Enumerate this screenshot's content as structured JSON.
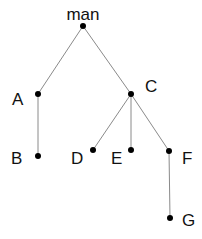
{
  "diagram": {
    "type": "tree",
    "colors": {
      "edge": "#8a8a8a",
      "node": "#000000",
      "label": "#111111",
      "background": "#ffffff"
    },
    "nodes": [
      {
        "id": "man",
        "label": "man",
        "x": 83,
        "y": 26,
        "lx": 83,
        "ly": 20,
        "anchor": "middle"
      },
      {
        "id": "A",
        "label": "A",
        "x": 38,
        "y": 94,
        "lx": 12,
        "ly": 105,
        "anchor": "start"
      },
      {
        "id": "C",
        "label": "C",
        "x": 131,
        "y": 94,
        "lx": 145,
        "ly": 92,
        "anchor": "start"
      },
      {
        "id": "B",
        "label": "B",
        "x": 38,
        "y": 156,
        "lx": 11,
        "ly": 164,
        "anchor": "start"
      },
      {
        "id": "D",
        "label": "D",
        "x": 93,
        "y": 150,
        "lx": 71,
        "ly": 164,
        "anchor": "start"
      },
      {
        "id": "E",
        "label": "E",
        "x": 131,
        "y": 150,
        "lx": 111,
        "ly": 164,
        "anchor": "start"
      },
      {
        "id": "F",
        "label": "F",
        "x": 169,
        "y": 151,
        "lx": 182,
        "ly": 164,
        "anchor": "start"
      },
      {
        "id": "G",
        "label": "G",
        "x": 170,
        "y": 218,
        "lx": 182,
        "ly": 226,
        "anchor": "start"
      }
    ],
    "edges": [
      {
        "from": "man",
        "to": "A"
      },
      {
        "from": "man",
        "to": "C"
      },
      {
        "from": "A",
        "to": "B"
      },
      {
        "from": "C",
        "to": "D"
      },
      {
        "from": "C",
        "to": "E"
      },
      {
        "from": "C",
        "to": "F"
      },
      {
        "from": "F",
        "to": "G"
      }
    ]
  }
}
